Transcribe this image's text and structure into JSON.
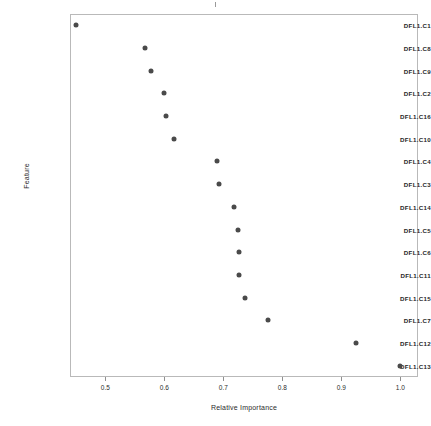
{
  "chart_data": {
    "type": "scatter",
    "title": "",
    "xlabel": "Relative Importance",
    "ylabel": "Feature",
    "xlim": [
      0.44,
      1.03
    ],
    "xticks": [
      0.5,
      0.6,
      0.7,
      0.8,
      0.9,
      1.0
    ],
    "xtick_labels": [
      "0.5",
      "0.6",
      "0.7",
      "0.8",
      "0.9",
      "1.0"
    ],
    "grid": false,
    "legend": null,
    "categories": [
      "DFL1.C1",
      "DFL1.C8",
      "DFL1.C9",
      "DFL1.C2",
      "DFL1.C16",
      "DFL1.C10",
      "DFL1.C4",
      "DFL1.C3",
      "DFL1.C14",
      "DFL1.C5",
      "DFL1.C6",
      "DFL1.C11",
      "DFL1.C15",
      "DFL1.C7",
      "DFL1.C12",
      "DFL1.C13"
    ],
    "values": [
      0.45,
      0.568,
      0.578,
      0.6,
      0.602,
      0.617,
      0.69,
      0.692,
      0.718,
      0.725,
      0.727,
      0.727,
      0.736,
      0.775,
      0.925,
      1.0
    ]
  }
}
